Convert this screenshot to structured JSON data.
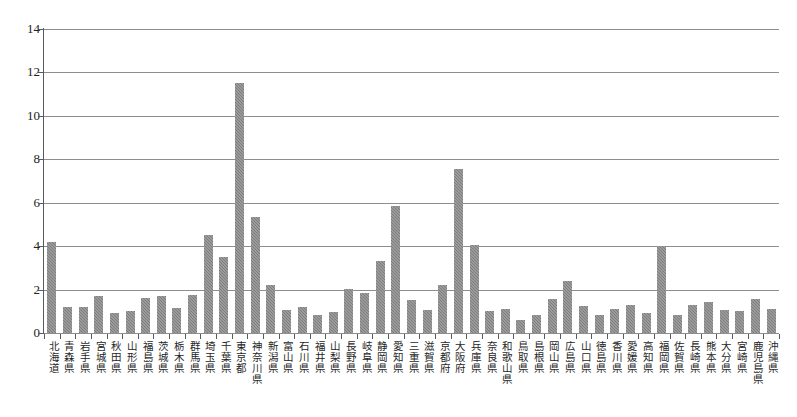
{
  "ghost_text": {
    "top": "",
    "bottom": ""
  },
  "axis": {
    "y_ticks": [
      "14",
      "12",
      "10",
      "8",
      "6",
      "4",
      "2",
      "0"
    ]
  },
  "chart_data": {
    "type": "bar",
    "title": "",
    "subtitle": "",
    "xlabel": "",
    "ylabel": "",
    "ylim": [
      0,
      14
    ],
    "ytick_step": 2,
    "grid": true,
    "legend": "none",
    "bar_color": "#7d7d7d",
    "categories": [
      "北海道",
      "青森県",
      "岩手県",
      "宮城県",
      "秋田県",
      "山形県",
      "福島県",
      "茨城県",
      "栃木県",
      "群馬県",
      "埼玉県",
      "千葉県",
      "東京都",
      "神奈川県",
      "新潟県",
      "富山県",
      "石川県",
      "福井県",
      "山梨県",
      "長野県",
      "岐阜県",
      "静岡県",
      "愛知県",
      "三重県",
      "滋賀県",
      "京都府",
      "大阪府",
      "兵庫県",
      "奈良県",
      "和歌山県",
      "鳥取県",
      "島根県",
      "岡山県",
      "広島県",
      "山口県",
      "徳島県",
      "香川県",
      "愛媛県",
      "高知県",
      "福岡県",
      "佐賀県",
      "長崎県",
      "熊本県",
      "大分県",
      "宮崎県",
      "鹿児島県",
      "沖縄県"
    ],
    "values": [
      4.2,
      1.2,
      1.2,
      1.7,
      0.9,
      1.0,
      1.6,
      1.7,
      1.15,
      1.75,
      4.5,
      3.5,
      11.5,
      5.35,
      2.2,
      1.05,
      1.2,
      0.85,
      0.95,
      2.05,
      1.85,
      3.3,
      5.85,
      1.5,
      1.05,
      2.2,
      7.55,
      4.05,
      1.0,
      1.1,
      0.6,
      0.85,
      1.55,
      2.4,
      1.25,
      0.85,
      1.1,
      1.3,
      0.9,
      4.0,
      0.85,
      1.3,
      1.45,
      1.05,
      1.0,
      1.55,
      1.1
    ]
  }
}
